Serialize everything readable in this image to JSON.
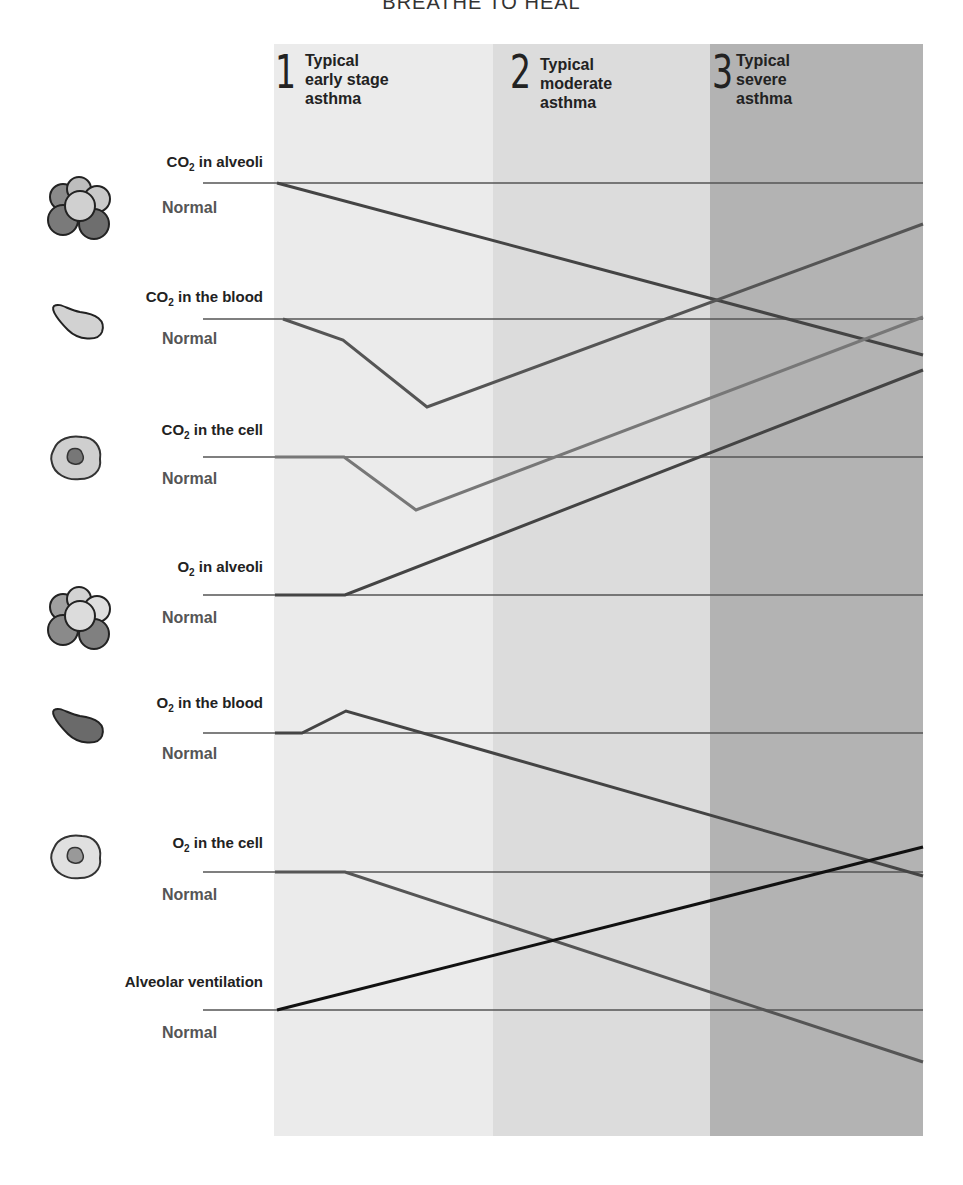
{
  "title": "BREATHE TO HEAL",
  "stages": [
    {
      "number": "1",
      "line1": "Typical",
      "line2": "early stage",
      "line3": "asthma",
      "bg": "#ebebeb",
      "x0": 274,
      "x1": 493
    },
    {
      "number": "2",
      "line1": "Typical",
      "line2": "moderate",
      "line3": "asthma",
      "bg": "#dcdcdc",
      "x0": 493,
      "x1": 710
    },
    {
      "number": "3",
      "line1": "Typical",
      "line2": "severe",
      "line3": "asthma",
      "bg": "#b3b3b3",
      "x0": 710,
      "x1": 923
    }
  ],
  "rows": [
    {
      "base": "CO",
      "sub": "2",
      "rest": " in alveoli",
      "normal": "Normal",
      "icon": "alveoli-icon"
    },
    {
      "base": "CO",
      "sub": "2",
      "rest": " in the blood",
      "normal": "Normal",
      "icon": "red-blood-cell-light-icon"
    },
    {
      "base": "CO",
      "sub": "2",
      "rest": " in the cell",
      "normal": "Normal",
      "icon": "body-cell-icon"
    },
    {
      "base": "O",
      "sub": "2",
      "rest": " in alveoli",
      "normal": "Normal",
      "icon": "alveoli-icon"
    },
    {
      "base": "O",
      "sub": "2",
      "rest": " in the blood",
      "normal": "Normal",
      "icon": "red-blood-cell-dark-icon"
    },
    {
      "base": "O",
      "sub": "2",
      "rest": " in the cell",
      "normal": "Normal",
      "icon": "body-cell-icon"
    },
    {
      "base": "Alveolar ventilation",
      "sub": "",
      "rest": "",
      "normal": "Normal",
      "icon": ""
    }
  ],
  "chart_data": {
    "type": "line",
    "title": "BREATHE TO HEAL",
    "xlabel": "Asthma severity stage",
    "ylabel": "Relative level vs. normal",
    "categories": [
      "1 Typical early stage asthma",
      "2 Typical moderate asthma",
      "3 Typical severe asthma"
    ],
    "grid": false,
    "legend": "none (labels at left of each row)",
    "normal_baselines_px": [
      183,
      319,
      457,
      595,
      733,
      872,
      1010
    ],
    "series": [
      {
        "name": "CO2 in alveoli",
        "color": "#444444",
        "trend": "decreasing",
        "points_px": [
          [
            277,
            183
          ],
          [
            923,
            355
          ]
        ]
      },
      {
        "name": "CO2 in the blood",
        "color": "#555555",
        "trend": "dip then strongly increasing",
        "points_px": [
          [
            283,
            319
          ],
          [
            343,
            340
          ],
          [
            427,
            407
          ],
          [
            923,
            224
          ]
        ]
      },
      {
        "name": "CO2 in the cell",
        "color": "#777777",
        "trend": "dip then increasing",
        "points_px": [
          [
            275,
            457
          ],
          [
            344,
            457
          ],
          [
            416,
            510
          ],
          [
            923,
            317
          ]
        ]
      },
      {
        "name": "O2 in alveoli",
        "color": "#444444",
        "trend": "increasing",
        "points_px": [
          [
            275,
            595
          ],
          [
            345,
            595
          ],
          [
            923,
            370
          ]
        ]
      },
      {
        "name": "O2 in the blood",
        "color": "#444444",
        "trend": "slight rise then decreasing",
        "points_px": [
          [
            275,
            733
          ],
          [
            302,
            733
          ],
          [
            346,
            711
          ],
          [
            923,
            876
          ]
        ]
      },
      {
        "name": "O2 in the cell",
        "color": "#555555",
        "trend": "decreasing",
        "points_px": [
          [
            275,
            872
          ],
          [
            345,
            872
          ],
          [
            923,
            1062
          ]
        ]
      },
      {
        "name": "Alveolar ventilation",
        "color": "#111111",
        "trend": "increasing",
        "points_px": [
          [
            277,
            1010
          ],
          [
            923,
            847
          ]
        ]
      }
    ]
  }
}
